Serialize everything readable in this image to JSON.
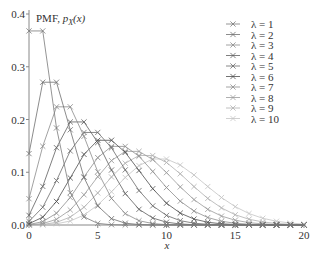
{
  "chart_data": {
    "type": "line",
    "title": "",
    "ylabel_annotation": "PMF, p_X(x)",
    "xlabel": "x",
    "xlim": [
      0,
      20
    ],
    "ylim": [
      0,
      0.4
    ],
    "x_ticks": [
      "0",
      "5",
      "10",
      "15",
      "20"
    ],
    "y_ticks": [
      "0.0",
      "0.1",
      "0.2",
      "0.3",
      "0.4"
    ],
    "grid": false,
    "legend_position": "upper right",
    "marker": "x",
    "x": [
      0,
      1,
      2,
      3,
      4,
      5,
      6,
      7,
      8,
      9,
      10,
      11,
      12,
      13,
      14,
      15,
      16,
      17,
      18,
      19,
      20
    ],
    "series": [
      {
        "name": "λ = 1",
        "lambda": 1,
        "color": "#7a7a7a"
      },
      {
        "name": "λ = 2",
        "lambda": 2,
        "color": "#6e6e6e"
      },
      {
        "name": "λ = 3",
        "lambda": 3,
        "color": "#8a8a8a"
      },
      {
        "name": "λ = 4",
        "lambda": 4,
        "color": "#5e5e5e"
      },
      {
        "name": "λ = 5",
        "lambda": 5,
        "color": "#6a6a6a"
      },
      {
        "name": "λ = 6",
        "lambda": 6,
        "color": "#4e4e4e"
      },
      {
        "name": "λ = 7",
        "lambda": 7,
        "color": "#8e8e8e"
      },
      {
        "name": "λ = 8",
        "lambda": 8,
        "color": "#9a9a9a"
      },
      {
        "name": "λ = 9",
        "lambda": 9,
        "color": "#b0b0b0"
      },
      {
        "name": "λ = 10",
        "lambda": 10,
        "color": "#c4c4c4"
      }
    ]
  },
  "labels": {
    "pmf": "PMF, ",
    "pmf_func": "p",
    "pmf_sub": "X",
    "pmf_arg": "(x)",
    "xlabel": "x"
  }
}
